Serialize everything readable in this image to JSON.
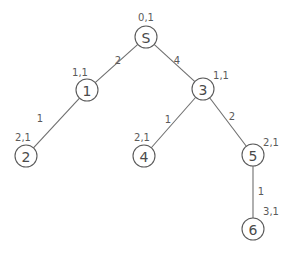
{
  "diagram": {
    "type": "tree",
    "colors": {
      "line": "#6e6e6e",
      "circle_stroke": "#5a5a5a",
      "text": "#4a4a4a",
      "background": "#ffffff"
    },
    "nodes": [
      {
        "id": "S",
        "label": "S",
        "annotation": "0,1",
        "cx": 146,
        "cy": 37,
        "ax": 146,
        "ay": 17
      },
      {
        "id": "1",
        "label": "1",
        "annotation": "1,1",
        "cx": 87,
        "cy": 90,
        "ax": 80,
        "ay": 72
      },
      {
        "id": "3",
        "label": "3",
        "annotation": "1,1",
        "cx": 203,
        "cy": 89,
        "ax": 221,
        "ay": 75
      },
      {
        "id": "2",
        "label": "2",
        "annotation": "2,1",
        "cx": 26,
        "cy": 156,
        "ax": 23,
        "ay": 137
      },
      {
        "id": "4",
        "label": "4",
        "annotation": "2,1",
        "cx": 144,
        "cy": 156,
        "ax": 142,
        "ay": 137
      },
      {
        "id": "5",
        "label": "5",
        "annotation": "2,1",
        "cx": 253,
        "cy": 155,
        "ax": 271,
        "ay": 142
      },
      {
        "id": "6",
        "label": "6",
        "annotation": "3,1",
        "cx": 253,
        "cy": 229,
        "ax": 271,
        "ay": 211
      }
    ],
    "edges": [
      {
        "from": "S",
        "to": "1",
        "weight": "2",
        "lx": 118,
        "ly": 60
      },
      {
        "from": "S",
        "to": "3",
        "weight": "4",
        "lx": 177,
        "ly": 60
      },
      {
        "from": "1",
        "to": "2",
        "weight": "1",
        "lx": 40,
        "ly": 118
      },
      {
        "from": "3",
        "to": "4",
        "weight": "1",
        "lx": 168,
        "ly": 119
      },
      {
        "from": "3",
        "to": "5",
        "weight": "2",
        "lx": 232,
        "ly": 116
      },
      {
        "from": "5",
        "to": "6",
        "weight": "1",
        "lx": 261,
        "ly": 191
      }
    ],
    "node_radius": 11
  }
}
